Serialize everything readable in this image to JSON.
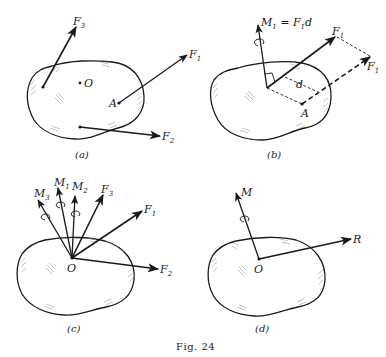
{
  "figure": {
    "caption": "Fig. 24"
  },
  "panels": [
    {
      "id": "a",
      "caption": "(a)",
      "point_labels": [
        "O",
        "A"
      ],
      "vectors": [
        {
          "name": "F",
          "sub": "3"
        },
        {
          "name": "F",
          "sub": "1"
        },
        {
          "name": "F",
          "sub": "2"
        }
      ]
    },
    {
      "id": "b",
      "caption": "(b)",
      "moment_label": {
        "lhs": "M",
        "lhs_sub": "1",
        "eq": " = ",
        "rhs": "F",
        "rhs_sub": "1",
        "rhs_tail": "d"
      },
      "distance_label": "d",
      "point_labels": [
        "A"
      ],
      "vectors": [
        {
          "name": "F",
          "sub": "1"
        },
        {
          "name": "F",
          "sub": "1"
        }
      ]
    },
    {
      "id": "c",
      "caption": "(c)",
      "point_labels": [
        "O"
      ],
      "moments": [
        {
          "name": "M",
          "sub": "3"
        },
        {
          "name": "M",
          "sub": "1"
        },
        {
          "name": "M",
          "sub": "2"
        }
      ],
      "vectors": [
        {
          "name": "F",
          "sub": "3"
        },
        {
          "name": "F",
          "sub": "1"
        },
        {
          "name": "F",
          "sub": "2"
        }
      ]
    },
    {
      "id": "d",
      "caption": "(d)",
      "point_labels": [
        "O"
      ],
      "moments": [
        {
          "name": "M"
        }
      ],
      "vectors": [
        {
          "name": "R"
        }
      ]
    }
  ]
}
